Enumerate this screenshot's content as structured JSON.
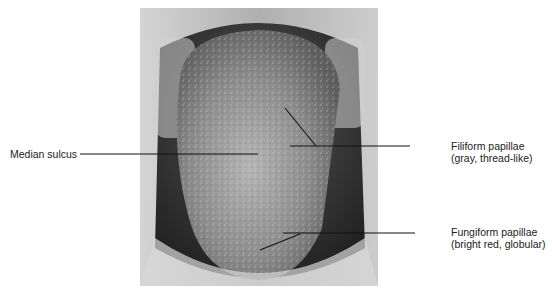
{
  "figure": {
    "labels": [
      {
        "id": "median-sulcus",
        "line1": "Median sulcus",
        "line2": ""
      },
      {
        "id": "filiform",
        "line1": "Filiform papillae",
        "line2": "(gray, thread-like)"
      },
      {
        "id": "fungiform",
        "line1": "Fungiform papillae",
        "line2": "(bright red, globular)"
      }
    ]
  }
}
